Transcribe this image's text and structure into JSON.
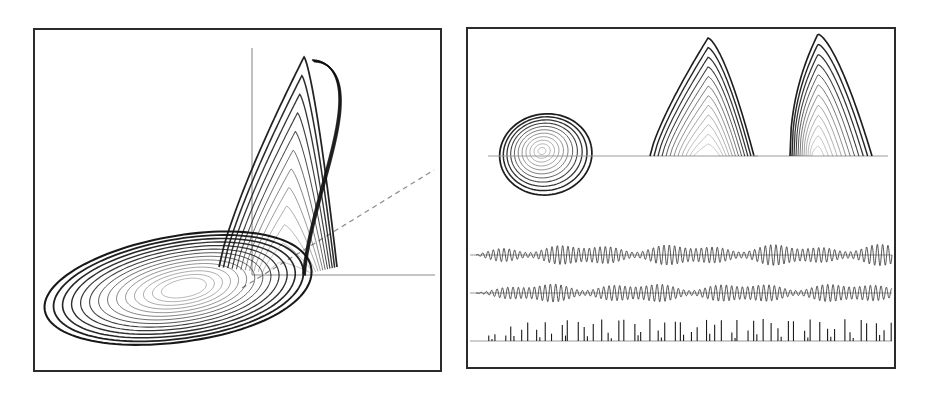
{
  "figure": {
    "background_color": "#ffffff",
    "frame_color": "#2b2b2b",
    "trajectory_color": "#111111",
    "axis_color": "#8c8c8c",
    "panel_count": 2
  },
  "panels": [
    {
      "id": "left-panel",
      "name": "phase-portrait-3d",
      "description": "Three-dimensional funnel-type chaotic attractor with flat spiral lobe and folded upward wing",
      "axes": {
        "vertical_axis": "z",
        "horizontal_axis": "x",
        "depth_axis_dashed": "y"
      }
    },
    {
      "id": "right-panel",
      "name": "projections-and-timeseries",
      "description": "Three projection views of the attractor above three time-series traces",
      "subpanels": [
        {
          "name": "projection-spiral",
          "label": "spiral projection"
        },
        {
          "name": "projection-arch",
          "label": "arch projection"
        },
        {
          "name": "projection-spike",
          "label": "spike projection"
        }
      ],
      "traces": [
        {
          "name": "timeseries-x",
          "type": "oscillatory"
        },
        {
          "name": "timeseries-y",
          "type": "oscillatory"
        },
        {
          "name": "timeseries-z",
          "type": "spike-train"
        }
      ]
    }
  ],
  "chart_data": {
    "type": "line",
    "xlabel": "",
    "ylabel": "",
    "grid": false,
    "legend": "none",
    "subplots": [
      {
        "name": "phase-portrait-3d",
        "type": "line",
        "description": "Projection of a chaotic (funnel/spiral Roessler-type) attractor in 3D phase space. A dense set of nested elliptical loops forms a flat lobe in the lower-left; trajectories fold upward on the right into a tall narrow wing of nested arcs.",
        "axis_origin": [
          250,
          247
        ],
        "vertical_axis_range": [
          40,
          247
        ],
        "horizontal_axis_range": [
          250,
          432
        ],
        "dashed_axis_end": [
          432,
          168
        ],
        "loop_count_lobe": 14,
        "loop_count_wing": 12
      },
      {
        "name": "projection-spiral",
        "type": "line",
        "description": "Nested closed loops spiralling inward to a central fixed point; roughly circular outline",
        "center": [
          540,
          148
        ],
        "outer_radius_x": 45,
        "outer_radius_y": 40,
        "turn_count": 11
      },
      {
        "name": "projection-arch",
        "type": "line",
        "description": "Nested arch-shaped loops rising from a common baseline, peak slightly left of centre",
        "baseline_y": 153,
        "peak": [
          705,
          43
        ],
        "arch_count": 12
      },
      {
        "name": "projection-spike",
        "type": "line",
        "description": "Sharp asymmetric spike of nested curves with a steep left flank and a long tail to the right",
        "baseline_y": 153,
        "peak": [
          812,
          40
        ],
        "curve_count": 12
      },
      {
        "name": "timeseries-x",
        "type": "line",
        "description": "Oscillatory time series with growing envelope from the left settling into chaotic amplitude modulation",
        "baseline_y": 254,
        "x_start": 472,
        "x_end": 894,
        "amplitude_max": 11,
        "cycle_count": 78
      },
      {
        "name": "timeseries-y",
        "type": "line",
        "description": "Second oscillatory time series, phase-shifted relative to the first, similar chaotic envelope",
        "baseline_y": 292,
        "x_start": 472,
        "x_end": 894,
        "amplitude_max": 10,
        "cycle_count": 78
      },
      {
        "name": "timeseries-z",
        "type": "line",
        "description": "Spike train with irregular spike heights, one spike per oscillation cycle",
        "baseline_y": 340,
        "x_start": 472,
        "x_end": 894,
        "amplitude_max": 22,
        "spike_count": 52
      }
    ]
  }
}
